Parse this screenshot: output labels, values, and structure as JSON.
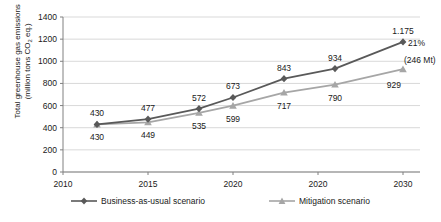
{
  "chart_data": {
    "type": "line",
    "title": "",
    "xlabel": "",
    "ylabel": "Total greenhouse gas emissions (million tons CO2 eq.)",
    "x": [
      2012,
      2015,
      2018,
      2020,
      2023,
      2026,
      2030
    ],
    "xtick_labels": [
      "2010",
      "2015",
      "2020",
      "2020",
      "2030"
    ],
    "xtick_values": [
      2010,
      2015,
      2020,
      2025,
      2030
    ],
    "xlim": [
      2010,
      2031
    ],
    "ylim": [
      0,
      1400
    ],
    "ytick_labels": [
      "0",
      "200",
      "400",
      "600",
      "800",
      "1000",
      "1200",
      "1400"
    ],
    "ytick_values": [
      0,
      200,
      400,
      600,
      800,
      1000,
      1200,
      1400
    ],
    "grid": "horizontal",
    "legend_position": "bottom",
    "series": [
      {
        "name": "Business-as-usual scenario",
        "marker": "diamond",
        "color": "#595959",
        "values": [
          430,
          477,
          572,
          673,
          843,
          934,
          1175
        ],
        "labels": [
          "430",
          "477",
          "572",
          "673",
          "843",
          "934",
          "1.175"
        ]
      },
      {
        "name": "Mitigation scenario",
        "marker": "triangle",
        "color": "#a6a6a6",
        "values": [
          430,
          449,
          535,
          599,
          717,
          790,
          929
        ],
        "labels": [
          "430",
          "449",
          "535",
          "599",
          "717",
          "790",
          "929"
        ]
      }
    ],
    "annotations": [
      {
        "text": "21%",
        "x": 2030,
        "y": 1175
      },
      {
        "text": "(246 Mt)",
        "x": 2030,
        "y": 1020
      }
    ]
  },
  "yaxis": {
    "title_line1": "Total greenhouse gas emissions",
    "title_line2_pre": "(million tons CO",
    "title_line2_sub": "2",
    "title_line2_post": " eq.)"
  },
  "legend": {
    "items": [
      {
        "label": "Business-as-usual scenario",
        "marker": "diamond-marker-icon"
      },
      {
        "label": "Mitigation scenario",
        "marker": "triangle-marker-icon"
      }
    ]
  },
  "colors": {
    "bau": "#595959",
    "mitigation": "#a6a6a6",
    "grid": "#d9d9d9",
    "axis": "#808080",
    "text": "#1a1a1a"
  }
}
